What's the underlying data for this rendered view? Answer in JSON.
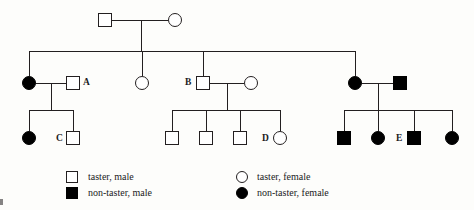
{
  "diagram": {
    "type": "pedigree-chart",
    "line_color": "#231f20",
    "fill_affected": "#000000",
    "fill_unaffected": "#ffffff",
    "generations": 3,
    "labels": {
      "a": "A",
      "b": "B",
      "c": "C",
      "d": "D",
      "e": "E"
    },
    "individuals": [
      {
        "id": "I-1",
        "generation": 1,
        "sex": "male",
        "phenotype": "taster",
        "label": ""
      },
      {
        "id": "I-2",
        "generation": 1,
        "sex": "female",
        "phenotype": "taster",
        "label": ""
      },
      {
        "id": "II-1",
        "generation": 2,
        "sex": "female",
        "phenotype": "non-taster",
        "label": ""
      },
      {
        "id": "II-2",
        "generation": 2,
        "sex": "male",
        "phenotype": "taster",
        "label": "A"
      },
      {
        "id": "II-3",
        "generation": 2,
        "sex": "female",
        "phenotype": "taster",
        "label": ""
      },
      {
        "id": "II-4",
        "generation": 2,
        "sex": "male",
        "phenotype": "taster",
        "label": "B"
      },
      {
        "id": "II-5",
        "generation": 2,
        "sex": "female",
        "phenotype": "taster",
        "label": ""
      },
      {
        "id": "II-6",
        "generation": 2,
        "sex": "female",
        "phenotype": "non-taster",
        "label": ""
      },
      {
        "id": "II-7",
        "generation": 2,
        "sex": "male",
        "phenotype": "non-taster",
        "label": ""
      },
      {
        "id": "III-1",
        "generation": 3,
        "sex": "female",
        "phenotype": "non-taster",
        "label": ""
      },
      {
        "id": "III-2",
        "generation": 3,
        "sex": "male",
        "phenotype": "taster",
        "label": "C"
      },
      {
        "id": "III-3",
        "generation": 3,
        "sex": "male",
        "phenotype": "taster",
        "label": ""
      },
      {
        "id": "III-4",
        "generation": 3,
        "sex": "male",
        "phenotype": "taster",
        "label": ""
      },
      {
        "id": "III-5",
        "generation": 3,
        "sex": "male",
        "phenotype": "taster",
        "label": ""
      },
      {
        "id": "III-6",
        "generation": 3,
        "sex": "female",
        "phenotype": "taster",
        "label": "D"
      },
      {
        "id": "III-7",
        "generation": 3,
        "sex": "male",
        "phenotype": "non-taster",
        "label": ""
      },
      {
        "id": "III-8",
        "generation": 3,
        "sex": "female",
        "phenotype": "non-taster",
        "label": ""
      },
      {
        "id": "III-9",
        "generation": 3,
        "sex": "male",
        "phenotype": "non-taster",
        "label": "E"
      },
      {
        "id": "III-10",
        "generation": 3,
        "sex": "female",
        "phenotype": "non-taster",
        "label": ""
      }
    ]
  },
  "legend": {
    "items": [
      {
        "key": "taster-male",
        "sex": "male",
        "state": "open",
        "text": "taster, male"
      },
      {
        "key": "non-taster-male",
        "sex": "male",
        "state": "filled",
        "text": "non-taster, male"
      },
      {
        "key": "taster-female",
        "sex": "female",
        "state": "open",
        "text": "taster, female"
      },
      {
        "key": "non-taster-female",
        "sex": "female",
        "state": "filled",
        "text": "non-taster, female"
      }
    ]
  }
}
